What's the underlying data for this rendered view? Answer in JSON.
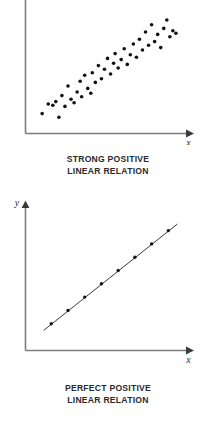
{
  "figures": [
    {
      "id": "strong-positive",
      "caption_line_1": "STRONG POSITIVE",
      "caption_line_2": "LINEAR RELATION",
      "x_axis_label": "x",
      "y_axis_label": "",
      "chart_data": {
        "type": "scatter",
        "title": "STRONG POSITIVE LINEAR RELATION",
        "xlabel": "x",
        "ylabel": "",
        "grid": false,
        "legend": "none",
        "xlim": [
          0,
          100
        ],
        "ylim": [
          0,
          100
        ],
        "axis_arrows": [
          "x"
        ],
        "marker": "filled-circle",
        "marker_color": "#111111",
        "marker_size_px": 2.6,
        "points": [
          [
            8,
            12
          ],
          [
            12,
            20
          ],
          [
            15,
            19
          ],
          [
            17,
            22
          ],
          [
            19,
            9
          ],
          [
            21,
            27
          ],
          [
            23,
            18
          ],
          [
            25,
            35
          ],
          [
            27,
            24
          ],
          [
            29,
            21
          ],
          [
            31,
            30
          ],
          [
            33,
            39
          ],
          [
            34,
            26
          ],
          [
            36,
            44
          ],
          [
            38,
            33
          ],
          [
            40,
            29
          ],
          [
            41,
            46
          ],
          [
            43,
            38
          ],
          [
            45,
            52
          ],
          [
            47,
            41
          ],
          [
            49,
            49
          ],
          [
            51,
            58
          ],
          [
            53,
            45
          ],
          [
            55,
            54
          ],
          [
            56,
            62
          ],
          [
            58,
            50
          ],
          [
            60,
            57
          ],
          [
            62,
            66
          ],
          [
            64,
            53
          ],
          [
            66,
            61
          ],
          [
            68,
            70
          ],
          [
            70,
            59
          ],
          [
            72,
            74
          ],
          [
            74,
            65
          ],
          [
            76,
            80
          ],
          [
            78,
            69
          ],
          [
            80,
            86
          ],
          [
            82,
            72
          ],
          [
            84,
            78
          ],
          [
            86,
            67
          ],
          [
            88,
            83
          ],
          [
            90,
            90
          ],
          [
            92,
            76
          ],
          [
            94,
            81
          ],
          [
            96,
            79
          ]
        ]
      }
    },
    {
      "id": "perfect-positive",
      "caption_line_1": "PERFECT POSITIVE",
      "caption_line_2": "LINEAR RELATION",
      "x_axis_label": "x",
      "y_axis_label": "y",
      "chart_data": {
        "type": "line",
        "title": "PERFECT POSITIVE LINEAR RELATION",
        "xlabel": "x",
        "ylabel": "y",
        "grid": false,
        "legend": "none",
        "xlim": [
          0,
          100
        ],
        "ylim": [
          0,
          100
        ],
        "axis_arrows": [
          "x",
          "y"
        ],
        "marker": "filled-circle",
        "marker_color": "#111111",
        "marker_size_px": 2.4,
        "line_color": "#3a3a3a",
        "line_width_px": 1,
        "line_extends_beyond_markers": true,
        "series": [
          {
            "name": "perfect positive",
            "x": [
              14,
              25,
              36,
              47,
              58,
              69,
              80,
              91
            ],
            "y": [
              16,
              26,
              36,
              46,
              56,
              66,
              76,
              86
            ]
          }
        ],
        "line_endpoints": {
          "start": [
            9,
            11
          ],
          "end": [
            97,
            91
          ]
        }
      }
    }
  ],
  "colors": {
    "axis": "#7d7d7d",
    "marker": "#111111",
    "line": "#3a3a3a",
    "text": "#2a2a2a",
    "background": "#ffffff"
  }
}
